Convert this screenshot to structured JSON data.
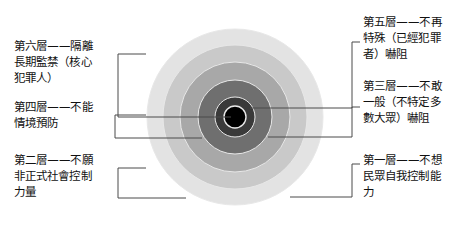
{
  "diagram": {
    "canvas": {
      "width": 470,
      "height": 236,
      "background": "#ffffff"
    },
    "center": {
      "x": 235,
      "y": 117
    },
    "connector_color": "#4a4a4a",
    "ring_stroke": "#e8e8e8",
    "rings": [
      {
        "index": 1,
        "name": "ring-outer-6",
        "radius": 88,
        "color": "#e3e3e3"
      },
      {
        "index": 2,
        "name": "ring-5",
        "radius": 72,
        "color": "#c9c9c9"
      },
      {
        "index": 3,
        "name": "ring-4",
        "radius": 55,
        "color": "#a8a8a8"
      },
      {
        "index": 4,
        "name": "ring-3",
        "radius": 37,
        "color": "#6f6f6f"
      },
      {
        "index": 5,
        "name": "ring-2",
        "radius": 20,
        "color": "#3a3a3a"
      },
      {
        "index": 6,
        "name": "ring-core-1",
        "radius": 11,
        "color": "#000000"
      }
    ]
  },
  "labels": {
    "left": [
      {
        "id": "layer-six",
        "text": "第六層——隔離\n長期監禁（核心\n犯罪人）",
        "x": 14,
        "y": 38
      },
      {
        "id": "layer-four",
        "text": "第四層——不能\n情境預防",
        "x": 14,
        "y": 99
      },
      {
        "id": "layer-two",
        "text": "第二層——不願\n非正式社會控制\n力量",
        "x": 14,
        "y": 152
      }
    ],
    "right": [
      {
        "id": "layer-five",
        "text": "第五層——不再\n特殊（已經犯罪\n者）嚇阻",
        "x": 363,
        "y": 14
      },
      {
        "id": "layer-three",
        "text": "第三層——不敢\n一般（不特定多\n數大眾）嚇阻",
        "x": 363,
        "y": 78
      },
      {
        "id": "layer-one",
        "text": "第一層——不想\n民眾自我控制能\n力",
        "x": 363,
        "y": 152
      }
    ]
  },
  "connectors": [
    {
      "id": "connector-layer-six",
      "side": "left",
      "path": "M 146 54 L 118 54 L 118 117 L 231 117"
    },
    {
      "id": "connector-layer-four",
      "side": "left",
      "path": "M 146 115 L 115 115 L 115 138 L 202 138"
    },
    {
      "id": "connector-layer-two",
      "side": "left",
      "path": "M 146 168 L 118 168 L 118 198 L 186 198"
    },
    {
      "id": "connector-layer-five",
      "side": "right",
      "path": "M 360 42 L 352 42 L 352 108 L 250 108"
    },
    {
      "id": "connector-layer-three",
      "side": "right",
      "path": "M 360 107 L 352 107 L 352 137 L 268 137"
    },
    {
      "id": "connector-layer-one",
      "side": "right",
      "path": "M 360 164 L 352 164 L 352 197 L 290 197"
    }
  ]
}
